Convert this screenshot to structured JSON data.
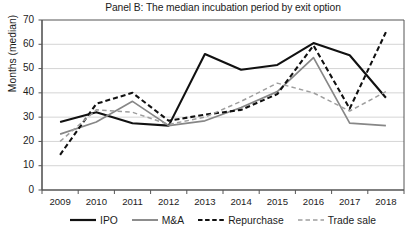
{
  "chart_data": {
    "type": "line",
    "title": "Panel B: The median incubation period by exit option",
    "xlabel": "",
    "ylabel": "Months (median)",
    "categories": [
      "2009",
      "2010",
      "2011",
      "2012",
      "2013",
      "2014",
      "2015",
      "2016",
      "2017",
      "2018"
    ],
    "x": [
      2009,
      2010,
      2011,
      2012,
      2013,
      2014,
      2015,
      2016,
      2017,
      2018
    ],
    "ylim": [
      0,
      70
    ],
    "yticks": [
      0,
      10,
      20,
      30,
      40,
      50,
      60,
      70
    ],
    "grid": true,
    "grid_axis": "y",
    "legend_position": "bottom",
    "series": [
      {
        "name": "IPO",
        "style": "solid",
        "color": "#111111",
        "width": 2.1,
        "values": [
          28,
          32,
          27.5,
          26.5,
          56,
          49.5,
          51.5,
          60.5,
          55.5,
          38
        ]
      },
      {
        "name": "M&A",
        "style": "solid",
        "color": "#878787",
        "width": 1.7,
        "values": [
          23,
          28,
          36.5,
          26.5,
          28.5,
          34,
          40.5,
          54.5,
          27.5,
          26.5
        ]
      },
      {
        "name": "Repurchase",
        "style": "dashed",
        "color": "#111111",
        "width": 2.1,
        "values": [
          14.5,
          35.5,
          40,
          28.5,
          31,
          33,
          39.5,
          59.5,
          33.5,
          65
        ]
      },
      {
        "name": "Trade sale",
        "style": "dashed",
        "color": "#9e9e9e",
        "width": 1.5,
        "values": [
          20,
          33,
          32,
          27,
          30,
          36.5,
          44,
          40,
          32.5,
          40.5
        ]
      }
    ]
  },
  "chart": {
    "title": "Panel B: The median incubation period by exit option",
    "y_axis_label": "Months (median)",
    "y_ticks": [
      "70",
      "60",
      "50",
      "40",
      "30",
      "20",
      "10",
      "0"
    ],
    "x_ticks": [
      "2009",
      "2010",
      "2011",
      "2012",
      "2013",
      "2014",
      "2015",
      "2016",
      "2017",
      "2018"
    ]
  },
  "legend": {
    "items": [
      {
        "label": "IPO",
        "swatch": "solid-black-line-icon"
      },
      {
        "label": "M&A",
        "swatch": "solid-gray-line-icon"
      },
      {
        "label": "Repurchase",
        "swatch": "dashed-black-line-icon"
      },
      {
        "label": "Trade sale",
        "swatch": "dashed-gray-line-icon"
      }
    ]
  },
  "colors": {
    "ipo": "#111111",
    "ma": "#878787",
    "repurchase": "#111111",
    "trade_sale": "#9e9e9e",
    "grid": "#c9c9c9",
    "axis": "#555555",
    "background": "#ffffff"
  }
}
